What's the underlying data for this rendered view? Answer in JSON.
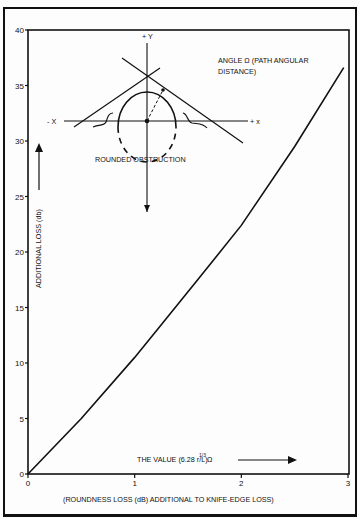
{
  "chart_data": {
    "type": "line",
    "title": "",
    "xlabel": "(ROUNDNESS LOSS (dB) ADDITIONAL TO KNIFE-EDGE LOSS)",
    "ylabel": "ADDITIONAL LOSS (db)",
    "x_axis_annotation": "THE VALUE (6.28 r/L)^1/3 Ω",
    "xlim": [
      0,
      3
    ],
    "ylim": [
      0,
      40
    ],
    "x_ticks": [
      "0",
      "1",
      "2",
      "3"
    ],
    "y_ticks": [
      "0",
      "5",
      "10",
      "15",
      "20",
      "25",
      "30",
      "35",
      "40"
    ],
    "grid": false,
    "legend": null,
    "series": [
      {
        "name": "Roundness loss",
        "x": [
          0,
          0.5,
          1.0,
          1.27,
          1.6,
          2.0,
          2.5,
          2.96
        ],
        "y": [
          0,
          5.0,
          10.5,
          13.7,
          17.6,
          22.4,
          29.5,
          36.6
        ]
      }
    ],
    "annotations": [
      "ANGLE Ω (PATH ANGULAR DISTANCE)",
      "ROUNDED OBSTRUCTION",
      "+ Y",
      "- X",
      "+ x"
    ]
  },
  "labels": {
    "y_axis": "ADDITIONAL LOSS (db)",
    "x_value": "THE VALUE (6.28 r/L)",
    "x_value_sup": "1/3",
    "x_value_omega": "Ω",
    "x_caption": "(ROUNDNESS LOSS (dB) ADDITIONAL TO KNIFE-EDGE LOSS)",
    "angle_line1": "ANGLE Ω (PATH ANGULAR",
    "angle_line2": "DISTANCE)",
    "obstruction": "ROUNDED OBSTRUCTION",
    "plus_y": "+ Y",
    "minus_x": "- X",
    "plus_x": "+ x"
  }
}
